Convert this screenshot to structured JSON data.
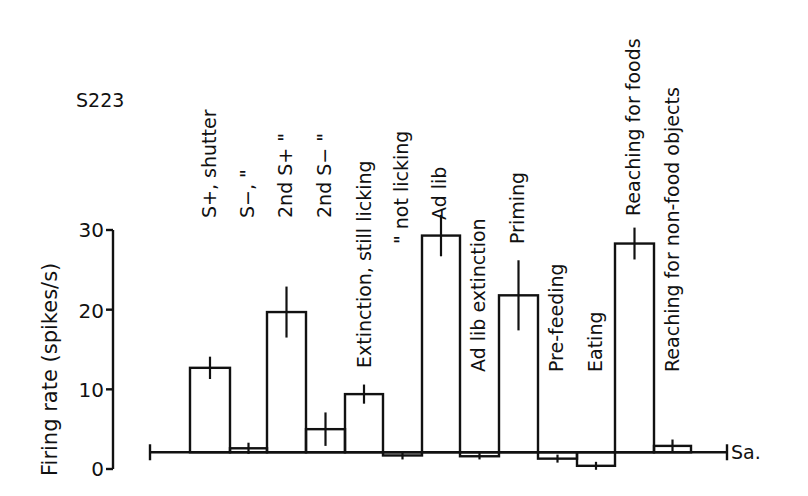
{
  "chart_data": {
    "type": "bar",
    "title": "S223",
    "xlabel": "",
    "ylabel": "Firing rate (spikes/s)",
    "ylim": [
      0,
      30
    ],
    "yticks": [
      0,
      10,
      20,
      30
    ],
    "baseline": {
      "label": "Sa.",
      "value": 2.1
    },
    "grid": false,
    "legend": null,
    "categories": [
      "S+, shutter",
      "S−, \"",
      "2nd S+ \"",
      "2nd S− \"",
      "Extinction, still licking",
      "\" not licking",
      "Ad lib",
      "Ad lib extinction",
      "Priming",
      "Pre-feeding",
      "Eating",
      "Reaching for foods",
      "Reaching for non-food objects"
    ],
    "values": [
      12.7,
      2.6,
      19.7,
      5.0,
      9.4,
      1.7,
      29.3,
      1.6,
      21.8,
      1.3,
      0.4,
      28.3,
      2.9
    ],
    "error": [
      1.4,
      0.7,
      3.2,
      2.1,
      1.2,
      0.5,
      2.6,
      0.4,
      4.4,
      0.5,
      0.5,
      2.0,
      0.8
    ]
  },
  "figure": {
    "cell_id": "S223",
    "y_axis_title": "Firing rate (spikes/s)",
    "y_tick_labels": [
      "0",
      "10",
      "20",
      "30"
    ],
    "baseline_label": "Sa."
  }
}
